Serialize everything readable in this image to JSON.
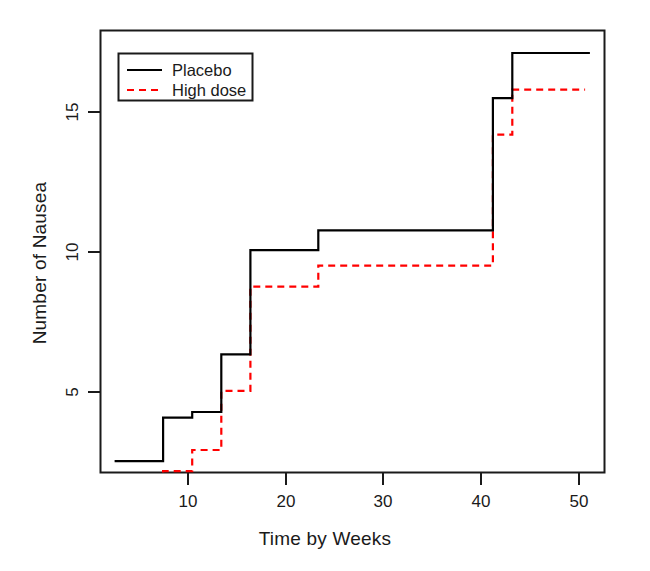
{
  "chart_data": {
    "type": "line",
    "subtype": "step",
    "title": "",
    "xlabel": "Time by Weeks",
    "ylabel": "Number of Nausea",
    "xlim": [
      1.5,
      53.5
    ],
    "ylim": [
      2.3,
      18.0
    ],
    "xticks": [
      10,
      20,
      30,
      40,
      50
    ],
    "xticklabels": [
      "10",
      "20",
      "30",
      "40",
      "50"
    ],
    "yticks": [
      5,
      10,
      15
    ],
    "yticklabels": [
      "5",
      "10",
      "15"
    ],
    "grid": false,
    "legend_position": "top-left",
    "frame": true,
    "series": [
      {
        "name": "Placebo",
        "color": "#000000",
        "linestyle": "solid",
        "x": [
          3.0,
          8.0,
          11.0,
          14.0,
          17.0,
          24.0,
          42.0,
          44.0,
          52.0
        ],
        "y": [
          2.7,
          4.25,
          4.45,
          6.5,
          10.2,
          10.9,
          15.6,
          17.2,
          17.2
        ]
      },
      {
        "name": "High dose",
        "color": "#ff0000",
        "linestyle": "dashed",
        "x": [
          8.0,
          11.0,
          14.0,
          17.0,
          24.0,
          42.0,
          44.0,
          51.5
        ],
        "y": [
          2.35,
          3.1,
          5.2,
          8.9,
          9.65,
          14.3,
          15.9,
          15.9
        ]
      }
    ]
  },
  "legend": {
    "entries": [
      {
        "label": "Placebo",
        "color": "#000000",
        "linestyle": "solid"
      },
      {
        "label": "High dose",
        "color": "#ff0000",
        "linestyle": "dashed"
      }
    ]
  },
  "axes": {
    "x_tick_labels": [
      "10",
      "20",
      "30",
      "40",
      "50"
    ],
    "y_tick_labels": [
      "5",
      "10",
      "15"
    ],
    "x_axis_title": "Time by Weeks",
    "y_axis_title": "Number of Nausea"
  },
  "colors": {
    "placebo": "#000000",
    "high_dose": "#ff0000",
    "frame": "#1a1a1a",
    "background": "#ffffff"
  }
}
